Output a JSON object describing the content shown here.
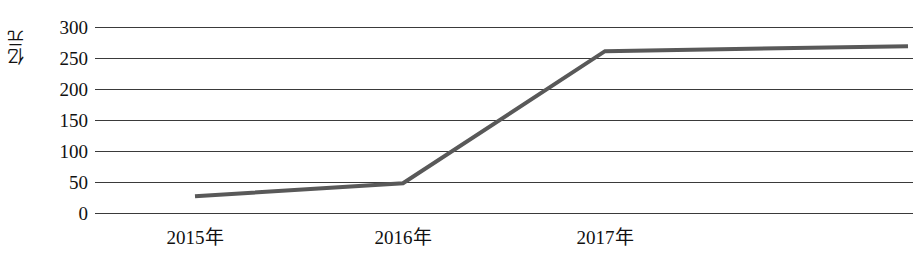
{
  "chart_data": {
    "type": "line",
    "title": "",
    "xlabel": "",
    "ylabel": "亿元",
    "categories": [
      "2015年",
      "2016年",
      "2017年",
      ""
    ],
    "x_positions_px": [
      195,
      403,
      605,
      908
    ],
    "values": [
      27,
      48,
      261,
      269
    ],
    "series": [
      {
        "name": "",
        "values": [
          27,
          48,
          261,
          269
        ],
        "color": "#595959"
      }
    ],
    "ylim": [
      0,
      300
    ],
    "y_ticks": [
      0,
      50,
      100,
      150,
      200,
      250,
      300
    ],
    "y_tick_labels": [
      "0",
      "50",
      "100",
      "150",
      "200",
      "250",
      "300"
    ],
    "grid": "horizontal",
    "legend": "none",
    "axis_color": "#3a3a3a",
    "line_color": "#595959",
    "line_width_px": 4
  },
  "axis": {
    "y_title": "亿元",
    "y_labels": [
      "300",
      "250",
      "200",
      "150",
      "100",
      "50",
      "0"
    ],
    "x_labels": [
      "2015年",
      "2016年",
      "2017年"
    ]
  }
}
